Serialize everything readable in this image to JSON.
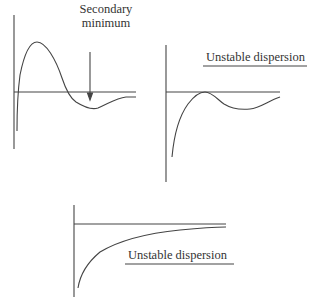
{
  "panels": [
    {
      "id": "secondary-minimum",
      "annotation_line1": "Secondary",
      "annotation_line2": "minimum",
      "has_arrow": true
    },
    {
      "id": "unstable-dispersion-1",
      "label": "Unstable dispersion"
    },
    {
      "id": "unstable-dispersion-2",
      "label": "Unstable dispersion"
    }
  ],
  "colors": {
    "line": "#444444",
    "text": "#333333",
    "background": "#ffffff"
  }
}
